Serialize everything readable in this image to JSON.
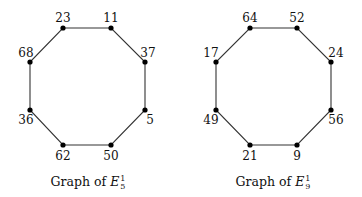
{
  "graphs": [
    {
      "caption_prefix": "Graph of ",
      "caption_symbol": "E",
      "caption_sub": "5",
      "caption_sup": "1",
      "nodes": [
        {
          "label": "23",
          "x": 63,
          "y": 28,
          "lx": 63,
          "ly": 22,
          "anchor": "middle"
        },
        {
          "label": "11",
          "x": 111,
          "y": 28,
          "lx": 111,
          "ly": 22,
          "anchor": "middle"
        },
        {
          "label": "37",
          "x": 145,
          "y": 62,
          "lx": 148,
          "ly": 57,
          "anchor": "middle"
        },
        {
          "label": "5",
          "x": 145,
          "y": 110,
          "lx": 150,
          "ly": 124,
          "anchor": "middle"
        },
        {
          "label": "50",
          "x": 111,
          "y": 145,
          "lx": 111,
          "ly": 160,
          "anchor": "middle"
        },
        {
          "label": "62",
          "x": 63,
          "y": 145,
          "lx": 63,
          "ly": 160,
          "anchor": "middle"
        },
        {
          "label": "36",
          "x": 30,
          "y": 110,
          "lx": 26,
          "ly": 124,
          "anchor": "middle"
        },
        {
          "label": "68",
          "x": 30,
          "y": 62,
          "lx": 26,
          "ly": 57,
          "anchor": "middle"
        }
      ]
    },
    {
      "caption_prefix": "Graph of ",
      "caption_symbol": "E",
      "caption_sub": "9",
      "caption_sup": "1",
      "nodes": [
        {
          "label": "64",
          "x": 250,
          "y": 28,
          "lx": 250,
          "ly": 22,
          "anchor": "middle"
        },
        {
          "label": "52",
          "x": 297,
          "y": 28,
          "lx": 297,
          "ly": 22,
          "anchor": "middle"
        },
        {
          "label": "24",
          "x": 331,
          "y": 62,
          "lx": 336,
          "ly": 57,
          "anchor": "middle"
        },
        {
          "label": "56",
          "x": 331,
          "y": 110,
          "lx": 336,
          "ly": 124,
          "anchor": "middle"
        },
        {
          "label": "9",
          "x": 297,
          "y": 145,
          "lx": 297,
          "ly": 160,
          "anchor": "middle"
        },
        {
          "label": "21",
          "x": 250,
          "y": 145,
          "lx": 250,
          "ly": 160,
          "anchor": "middle"
        },
        {
          "label": "49",
          "x": 216,
          "y": 110,
          "lx": 211,
          "ly": 124,
          "anchor": "middle"
        },
        {
          "label": "17",
          "x": 216,
          "y": 62,
          "lx": 211,
          "ly": 57,
          "anchor": "middle"
        }
      ]
    }
  ],
  "caption_positions": [
    {
      "x": 88,
      "y": 186
    },
    {
      "x": 273,
      "y": 186
    }
  ]
}
